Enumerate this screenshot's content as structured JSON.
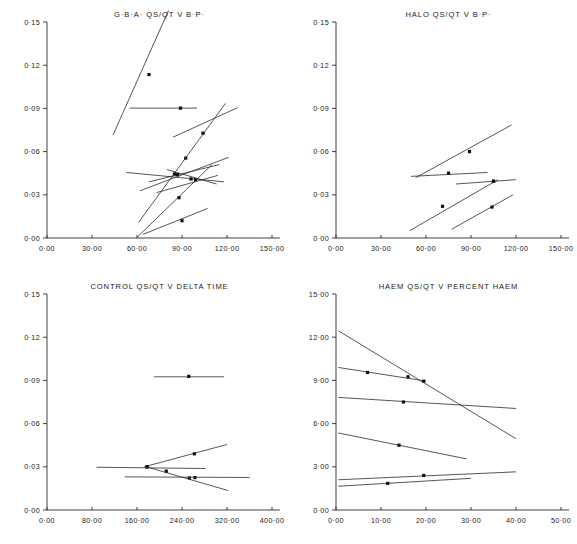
{
  "figure": {
    "background": "#ffffff",
    "line_color": "#2b2b2b",
    "marker_color": "#111111",
    "axis_color": "#2a2a2a"
  },
  "chart_data": [
    {
      "id": "gba-qsqt-v-bp",
      "type": "line",
      "title": "G·B·A· QS/QT V B·P·",
      "xlabel": "",
      "ylabel": "",
      "xlim": [
        0,
        150
      ],
      "ylim": [
        0.0,
        0.15
      ],
      "grid": false,
      "legend": "none",
      "xticks": [
        0,
        30,
        60,
        90,
        120,
        150
      ],
      "xticklabels": [
        "0·00",
        "30·00",
        "60·00",
        "90·00",
        "120·00",
        "150·00"
      ],
      "yticks": [
        0.0,
        0.03,
        0.06,
        0.09,
        0.12,
        0.15
      ],
      "yticklabels": [
        "0·00",
        "0·03",
        "0·06",
        "0·09",
        "0·12",
        "0·15"
      ],
      "series": [
        {
          "name": "s1",
          "x": [
            44.0,
            81.0
          ],
          "y": [
            0.0715,
            0.158
          ],
          "points": [
            [
              68.0,
              0.1135
            ]
          ]
        },
        {
          "name": "s2",
          "x": [
            55.0,
            100.0
          ],
          "y": [
            0.0902,
            0.0902
          ],
          "points": [
            [
              89.0,
              0.0902
            ]
          ]
        },
        {
          "name": "s3",
          "x": [
            61.0,
            119.0
          ],
          "y": [
            0.0108,
            0.0935
          ],
          "points": [
            [
              85.0,
              0.0445
            ],
            [
              92.5,
              0.0555
            ],
            [
              104.0,
              0.0728
            ]
          ]
        },
        {
          "name": "s4",
          "x": [
            84.0,
            127.0
          ],
          "y": [
            0.07,
            0.0905
          ],
          "points": []
        },
        {
          "name": "s5",
          "x": [
            53.0,
            118.0
          ],
          "y": [
            0.0455,
            0.039
          ],
          "points": []
        },
        {
          "name": "s6",
          "x": [
            62.0,
            121.0
          ],
          "y": [
            0.0328,
            0.056
          ],
          "points": []
        },
        {
          "name": "s7",
          "x": [
            68.0,
            115.0
          ],
          "y": [
            0.039,
            0.051
          ],
          "points": []
        },
        {
          "name": "s8",
          "x": [
            73.0,
            114.0
          ],
          "y": [
            0.0315,
            0.0435
          ],
          "points": []
        },
        {
          "name": "s9",
          "x": [
            60.0,
            110.0
          ],
          "y": [
            0.0004,
            0.051
          ],
          "points": [
            [
              88.0,
              0.028
            ],
            [
              99.0,
              0.0405
            ]
          ]
        },
        {
          "name": "s10",
          "x": [
            64.0,
            107.0
          ],
          "y": [
            0.0025,
            0.0205
          ],
          "points": [
            [
              90.0,
              0.012
            ]
          ]
        },
        {
          "name": "s11",
          "x": [
            80.0,
            113.0
          ],
          "y": [
            0.0475,
            0.0375
          ],
          "points": [
            [
              87.0,
              0.044
            ],
            [
              96.0,
              0.041
            ]
          ]
        }
      ]
    },
    {
      "id": "halo-qsqt-v-bp",
      "type": "line",
      "title": "HALO QS/QT V B·P·",
      "xlabel": "",
      "ylabel": "",
      "xlim": [
        0,
        150
      ],
      "ylim": [
        0.0,
        0.15
      ],
      "grid": false,
      "legend": "none",
      "xticks": [
        0,
        30,
        60,
        90,
        120,
        150
      ],
      "xticklabels": [
        "0·00",
        "30·00",
        "60·00",
        "90·00",
        "120·00",
        "150·00"
      ],
      "yticks": [
        0.0,
        0.03,
        0.06,
        0.09,
        0.12,
        0.15
      ],
      "yticklabels": [
        "0·00",
        "0·03",
        "0·06",
        "0·09",
        "0·12",
        "0·15"
      ],
      "series": [
        {
          "name": "h1",
          "x": [
            53.0,
            117.0
          ],
          "y": [
            0.0418,
            0.0785
          ],
          "points": [
            [
              89.0,
              0.06
            ]
          ]
        },
        {
          "name": "h2",
          "x": [
            50.0,
            101.0
          ],
          "y": [
            0.0428,
            0.0455
          ],
          "points": [
            [
              75.0,
              0.045
            ]
          ]
        },
        {
          "name": "h3",
          "x": [
            80.0,
            120.0
          ],
          "y": [
            0.0375,
            0.0405
          ],
          "points": [
            [
              105.0,
              0.0395
            ]
          ]
        },
        {
          "name": "h4",
          "x": [
            49.0,
            108.0
          ],
          "y": [
            0.005,
            0.0405
          ],
          "points": [
            [
              71.0,
              0.022
            ],
            [
              105.0,
              0.0393
            ]
          ]
        },
        {
          "name": "h5",
          "x": [
            77.0,
            118.0
          ],
          "y": [
            0.006,
            0.03
          ],
          "points": [
            [
              104.0,
              0.0215
            ]
          ]
        }
      ]
    },
    {
      "id": "control-qsqt-v-delta-time",
      "type": "line",
      "title": "CONTROL QS/QT V DELTA TIME",
      "xlabel": "",
      "ylabel": "",
      "xlim": [
        0,
        400
      ],
      "ylim": [
        0.0,
        0.15
      ],
      "grid": false,
      "legend": "none",
      "xticks": [
        0,
        80,
        160,
        240,
        320,
        400
      ],
      "xticklabels": [
        "0·00",
        "80·00",
        "160·00",
        "240·00",
        "320·00",
        "400·00"
      ],
      "yticks": [
        0.0,
        0.03,
        0.06,
        0.09,
        0.12,
        0.15
      ],
      "yticklabels": [
        "0·00",
        "0·03",
        "0·06",
        "0·09",
        "0·12",
        "0·15"
      ],
      "series": [
        {
          "name": "c1",
          "x": [
            190.0,
            315.0
          ],
          "y": [
            0.0925,
            0.0925
          ],
          "points": [
            [
              252.0,
              0.0928
            ]
          ]
        },
        {
          "name": "c2",
          "x": [
            173.0,
            320.0
          ],
          "y": [
            0.03,
            0.0455
          ],
          "points": [
            [
              178.0,
              0.03
            ],
            [
              262.0,
              0.039
            ]
          ]
        },
        {
          "name": "c3",
          "x": [
            174.0,
            322.0
          ],
          "y": [
            0.0303,
            0.0135
          ],
          "points": [
            [
              178.0,
              0.03
            ],
            [
              253.0,
              0.0222
            ],
            [
              263.0,
              0.0225
            ]
          ]
        },
        {
          "name": "c4",
          "x": [
            88.0,
            282.0
          ],
          "y": [
            0.0297,
            0.0288
          ],
          "points": [
            [
              212.0,
              0.027
            ]
          ]
        },
        {
          "name": "c5",
          "x": [
            138.0,
            360.0
          ],
          "y": [
            0.023,
            0.0226
          ],
          "points": []
        }
      ]
    },
    {
      "id": "haem-qsqt-v-percent-haem",
      "type": "line",
      "title": "HAEM QS/QT V PERCENT HAEM",
      "xlabel": "",
      "ylabel": "",
      "xlim": [
        0,
        50
      ],
      "ylim": [
        0.0,
        15.0
      ],
      "grid": false,
      "legend": "none",
      "xticks": [
        0,
        10,
        20,
        30,
        40,
        50
      ],
      "xticklabels": [
        "0·00",
        "10·00",
        "20·00",
        "30·00",
        "40·00",
        "50·00"
      ],
      "yticks": [
        0.0,
        3.0,
        6.0,
        9.0,
        12.0,
        15.0
      ],
      "yticklabels": [
        "0·00",
        "3·00",
        "6·00",
        "9·00",
        "12·00",
        "15·00"
      ],
      "series": [
        {
          "name": "m1",
          "x": [
            0.5,
            40.0
          ],
          "y": [
            12.45,
            4.95
          ],
          "points": []
        },
        {
          "name": "m2",
          "x": [
            0.5,
            20.0
          ],
          "y": [
            9.9,
            8.95
          ],
          "points": [
            [
              7.0,
              9.55
            ],
            [
              16.0,
              9.25
            ],
            [
              19.5,
              8.95
            ]
          ]
        },
        {
          "name": "m3",
          "x": [
            0.5,
            40.0
          ],
          "y": [
            7.82,
            7.05
          ],
          "points": [
            [
              15.0,
              7.5
            ]
          ]
        },
        {
          "name": "m4",
          "x": [
            0.5,
            29.0
          ],
          "y": [
            5.35,
            3.55
          ],
          "points": [
            [
              14.0,
              4.5
            ]
          ]
        },
        {
          "name": "m5",
          "x": [
            0.5,
            40.0
          ],
          "y": [
            2.1,
            2.65
          ],
          "points": [
            [
              19.5,
              2.4
            ]
          ]
        },
        {
          "name": "m6",
          "x": [
            0.5,
            30.0
          ],
          "y": [
            1.65,
            2.2
          ],
          "points": [
            [
              11.5,
              1.85
            ]
          ]
        }
      ]
    }
  ]
}
